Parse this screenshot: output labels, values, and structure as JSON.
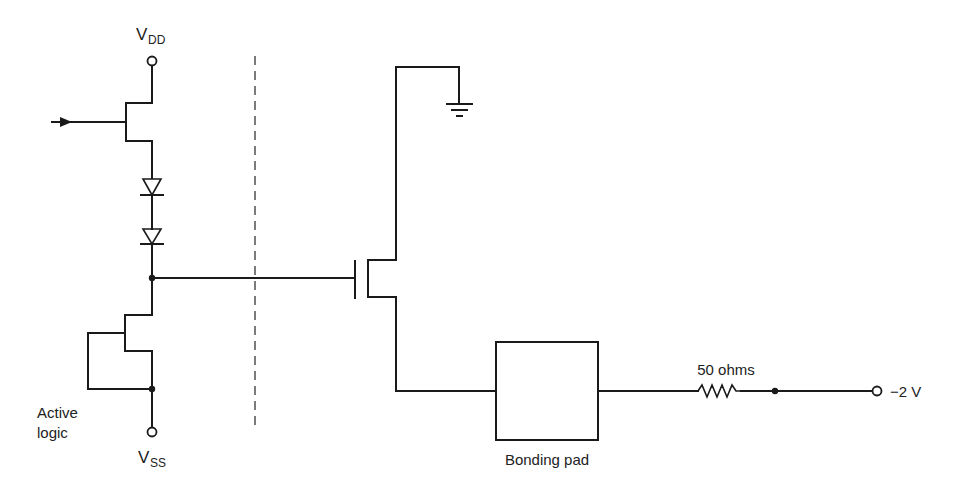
{
  "diagram": {
    "type": "circuit-schematic",
    "labels": {
      "vdd_main": "V",
      "vdd_sub": "DD",
      "vss_main": "V",
      "vss_sub": "SS",
      "active_logic_line1": "Active",
      "active_logic_line2": "logic",
      "bonding_pad": "Bonding pad",
      "resistor": "50 ohms",
      "output_voltage": "−2 V"
    },
    "components": [
      {
        "id": "input-arrow",
        "kind": "signal-input"
      },
      {
        "id": "upper-fet",
        "kind": "JFET/MESFET",
        "connected_to": [
          "VDD",
          "diode-1"
        ]
      },
      {
        "id": "diode-1",
        "kind": "diode"
      },
      {
        "id": "diode-2",
        "kind": "diode"
      },
      {
        "id": "lower-fet",
        "kind": "FET (gate tied to source, current source)",
        "connected_to": [
          "VSS"
        ]
      },
      {
        "id": "output-fet",
        "kind": "MOSFET",
        "drain": "ground",
        "source": "bonding-pad"
      },
      {
        "id": "ground",
        "kind": "ground"
      },
      {
        "id": "bonding-pad",
        "kind": "pad"
      },
      {
        "id": "resistor-50",
        "kind": "resistor",
        "value": "50 ohms"
      },
      {
        "id": "terminal-minus2v",
        "kind": "terminal",
        "value": "−2 V"
      }
    ],
    "boundary": "dashed vertical separator between on-chip active logic and output driver",
    "colors": {
      "line": "#1a1a1a",
      "background": "#ffffff"
    }
  }
}
